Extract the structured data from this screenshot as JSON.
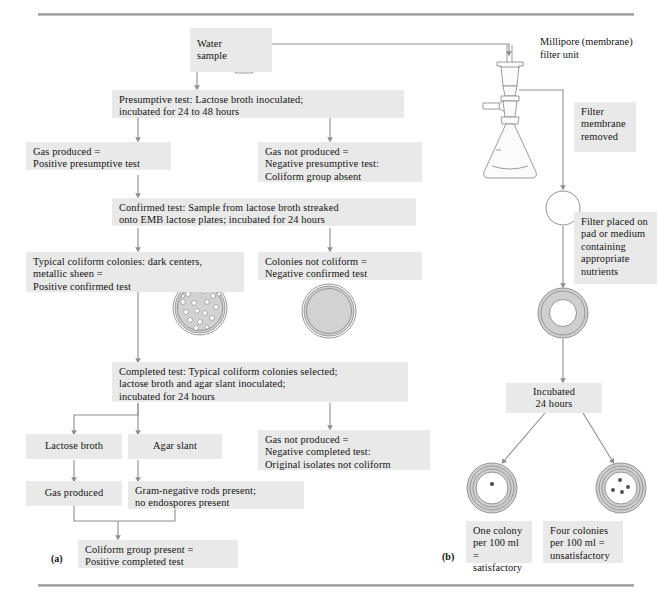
{
  "figure": {
    "panel_a_label": "(a)",
    "panel_b_label": "(b)"
  },
  "panel_a": {
    "water_sample": "Water\nsample",
    "presumptive": "Presumptive test: Lactose broth inoculated;\nincubated for 24 to 48 hours",
    "gas_produced_pos": "Gas produced =\nPositive presumptive test",
    "gas_not_produced_neg": "Gas not produced =\nNegative presumptive test:\nColiform group absent",
    "confirmed": "Confirmed test: Sample from lactose broth streaked\nonto EMB lactose plates; incubated for 24 hours",
    "typical_coliform": "Typical coliform colonies: dark centers,\nmetallic sheen  =\nPositive confirmed test",
    "colonies_not_coliform": "Colonies not coliform =\nNegative confirmed test",
    "completed": "Completed test: Typical coliform colonies selected;\nlactose broth and agar slant inoculated;\nincubated for 24 hours",
    "lactose_broth": "Lactose broth",
    "agar_slant": "Agar slant",
    "gas_produced": "Gas produced",
    "gram_negative": "Gram-negative rods present;\nno endospores present",
    "gas_not_produced_completed": "Gas not produced =\nNegative completed test:\nOriginal isolates not coliform",
    "coliform_present": "Coliform group present =\nPositive completed test"
  },
  "panel_b": {
    "millipore_label": "Millipore (membrane)\nfilter unit",
    "filter_membrane_removed": "Filter\nmembrane\nremoved",
    "filter_placed": "Filter placed on\npad or medium\ncontaining\nappropriate\nnutrients",
    "incubated": "Incubated\n24 hours",
    "one_colony": "One colony\nper 100 ml =\nsatisfactory",
    "four_colonies": "Four colonies\nper 100 ml =\nunsatisfactory"
  },
  "colors": {
    "box_fill": "#e9e9e9",
    "line": "#8f8f8f",
    "dish_fill": "#d2d2d2",
    "membrane_fill": "#cfcfcf",
    "rule": "#9a9a9a",
    "text": "#141414"
  }
}
